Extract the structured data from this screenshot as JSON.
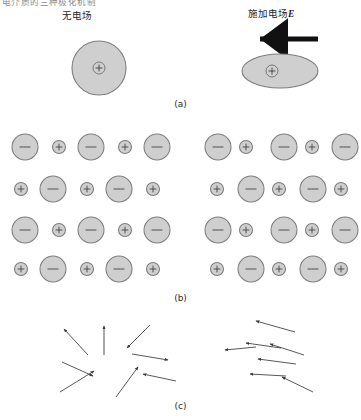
{
  "figure": {
    "cut_caption": "电介质的三种极化机制",
    "column_labels": {
      "left": "无电场",
      "right_prefix": "施加电场",
      "right_symbol": "E"
    },
    "panel_captions": {
      "a": "(a)",
      "b": "(b)",
      "c": "(c)"
    },
    "charge_symbols": {
      "positive": "+",
      "negative": "−"
    },
    "colors": {
      "ion_fill": "#cfcfcf",
      "ion_stroke": "#7d7d7d",
      "arrow": "#3a3a3a",
      "text": "#1f1f1f",
      "background": "#ffffff"
    }
  },
  "chart_data": {
    "type": "diagram",
    "title": "电介质的三种极化机制",
    "columns": [
      "无电场",
      "施加电场E"
    ],
    "panels": [
      {
        "id": "a",
        "caption": "(a)",
        "name": "electronic-polarization",
        "left": {
          "shape": "circle",
          "cx": 99,
          "cy": 68,
          "rx": 27,
          "ry": 27,
          "nucleus": {
            "cx": 99,
            "cy": 68,
            "r": 6,
            "symbol": "+"
          }
        },
        "right": {
          "shape": "ellipse",
          "cx": 280,
          "cy": 71,
          "rx": 38,
          "ry": 17,
          "nucleus": {
            "cx": 272,
            "cy": 71,
            "r": 6,
            "symbol": "+"
          }
        },
        "field_arrow": {
          "x1": 318,
          "y1": 39,
          "x2": 254,
          "y2": 39,
          "direction": "left"
        }
      },
      {
        "id": "b",
        "caption": "(b)",
        "name": "ionic-polarization",
        "left_lattice": {
          "anion_radius": 13,
          "cation_radius": 6.5,
          "rows": [
            {
              "y": 147,
              "cells": [
                {
                  "x": 25,
                  "type": "anion"
                },
                {
                  "x": 59,
                  "type": "cation"
                },
                {
                  "x": 91,
                  "type": "anion"
                },
                {
                  "x": 125,
                  "type": "cation"
                },
                {
                  "x": 157,
                  "type": "anion"
                }
              ]
            },
            {
              "y": 189,
              "cells": [
                {
                  "x": 21,
                  "type": "cation"
                },
                {
                  "x": 53,
                  "type": "anion"
                },
                {
                  "x": 87,
                  "type": "cation"
                },
                {
                  "x": 119,
                  "type": "anion"
                },
                {
                  "x": 153,
                  "type": "cation"
                }
              ]
            },
            {
              "y": 230,
              "cells": [
                {
                  "x": 25,
                  "type": "anion"
                },
                {
                  "x": 59,
                  "type": "cation"
                },
                {
                  "x": 91,
                  "type": "anion"
                },
                {
                  "x": 125,
                  "type": "cation"
                },
                {
                  "x": 157,
                  "type": "anion"
                }
              ]
            },
            {
              "y": 269,
              "cells": [
                {
                  "x": 21,
                  "type": "cation"
                },
                {
                  "x": 53,
                  "type": "anion"
                },
                {
                  "x": 87,
                  "type": "cation"
                },
                {
                  "x": 119,
                  "type": "anion"
                },
                {
                  "x": 153,
                  "type": "cation"
                }
              ]
            }
          ]
        },
        "right_lattice": {
          "anion_radius": 13,
          "cation_radius": 6.5,
          "cation_shift": -7,
          "rows": [
            {
              "y": 147,
              "cells": [
                {
                  "x": 218,
                  "type": "anion"
                },
                {
                  "x": 246,
                  "type": "cation"
                },
                {
                  "x": 284,
                  "type": "anion"
                },
                {
                  "x": 312,
                  "type": "cation"
                },
                {
                  "x": 345,
                  "type": "anion"
                }
              ]
            },
            {
              "y": 189,
              "cells": [
                {
                  "x": 217,
                  "type": "cation"
                },
                {
                  "x": 251,
                  "type": "anion"
                },
                {
                  "x": 279,
                  "type": "cation"
                },
                {
                  "x": 313,
                  "type": "anion"
                },
                {
                  "x": 341,
                  "type": "cation"
                }
              ]
            },
            {
              "y": 230,
              "cells": [
                {
                  "x": 218,
                  "type": "anion"
                },
                {
                  "x": 246,
                  "type": "cation"
                },
                {
                  "x": 284,
                  "type": "anion"
                },
                {
                  "x": 312,
                  "type": "cation"
                },
                {
                  "x": 345,
                  "type": "anion"
                }
              ]
            },
            {
              "y": 269,
              "cells": [
                {
                  "x": 217,
                  "type": "cation"
                },
                {
                  "x": 251,
                  "type": "anion"
                },
                {
                  "x": 279,
                  "type": "cation"
                },
                {
                  "x": 313,
                  "type": "anion"
                },
                {
                  "x": 341,
                  "type": "cation"
                }
              ]
            }
          ]
        }
      },
      {
        "id": "c",
        "caption": "(c)",
        "name": "orientation-polarization",
        "left_dipoles": [
          {
            "x1": 88,
            "y1": 355,
            "x2": 64,
            "y2": 329
          },
          {
            "x1": 104,
            "y1": 355,
            "x2": 104,
            "y2": 326
          },
          {
            "x1": 150,
            "y1": 325,
            "x2": 127,
            "y2": 348
          },
          {
            "x1": 62,
            "y1": 362,
            "x2": 93,
            "y2": 376
          },
          {
            "x1": 132,
            "y1": 354,
            "x2": 168,
            "y2": 360
          },
          {
            "x1": 60,
            "y1": 392,
            "x2": 94,
            "y2": 371
          },
          {
            "x1": 116,
            "y1": 397,
            "x2": 138,
            "y2": 367
          },
          {
            "x1": 176,
            "y1": 381,
            "x2": 143,
            "y2": 374
          }
        ],
        "right_dipoles": [
          {
            "x1": 295,
            "y1": 332,
            "x2": 256,
            "y2": 321
          },
          {
            "x1": 281,
            "y1": 348,
            "x2": 246,
            "y2": 343
          },
          {
            "x1": 304,
            "y1": 355,
            "x2": 270,
            "y2": 344
          },
          {
            "x1": 256,
            "y1": 347,
            "x2": 225,
            "y2": 350
          },
          {
            "x1": 296,
            "y1": 364,
            "x2": 258,
            "y2": 359
          },
          {
            "x1": 286,
            "y1": 376,
            "x2": 250,
            "y2": 374
          },
          {
            "x1": 313,
            "y1": 392,
            "x2": 282,
            "y2": 377
          }
        ]
      }
    ]
  }
}
